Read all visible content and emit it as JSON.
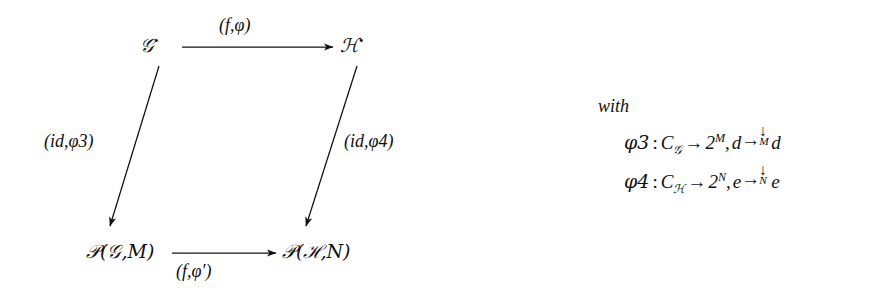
{
  "diagram": {
    "type": "commutative-square",
    "nodes": {
      "top_left": "𝒢",
      "top_left_sup": "•",
      "top_right": "ℋ",
      "top_right_sup": "•",
      "bottom_left_head": "𝒫",
      "bottom_left_body": "(𝒢,M)",
      "bottom_right_head": "𝒫",
      "bottom_right_body": "(ℋ,N)"
    },
    "edges": {
      "top": "(f,φ)",
      "left": "(id,φ3)",
      "right": "(id,φ4)",
      "bottom": "(f,φ′)"
    }
  },
  "with_block": {
    "heading": "with",
    "formulas": [
      {
        "name": "φ3",
        "colon": ":",
        "domain_sym": "C",
        "domain_sub": "𝒢",
        "arrow": "→",
        "codomain_base": "2",
        "codomain_exp": "M",
        "comma": ",",
        "element": "d",
        "map_arrow": "→",
        "map_down": "↓",
        "map_sub": "M",
        "image": "d"
      },
      {
        "name": "φ4",
        "colon": ":",
        "domain_sym": "C",
        "domain_sub": "ℋ",
        "arrow": "→",
        "codomain_base": "2",
        "codomain_exp": "N",
        "comma": ",",
        "element": "e",
        "map_arrow": "→",
        "map_down": "↓",
        "map_sub": "N",
        "image": "e"
      }
    ]
  },
  "colors": {
    "ink": "#101010",
    "background": "#ffffff"
  }
}
